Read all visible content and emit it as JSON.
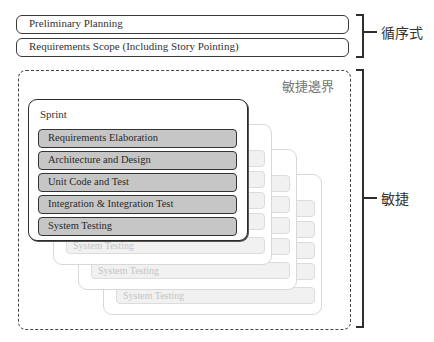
{
  "waterfall": {
    "items": [
      {
        "label": "Preliminary Planning"
      },
      {
        "label": "Requirements Scope (Including Story Pointing)"
      }
    ],
    "bracket_label": "循序式"
  },
  "agile": {
    "boundary_label": "敏捷邊界",
    "bracket_label": "敏捷",
    "sprint": {
      "title": "Sprint",
      "phases": [
        {
          "label": "Requirements Elaboration"
        },
        {
          "label": "Architecture and Design"
        },
        {
          "label": "Unit Code and Test"
        },
        {
          "label": "Integration & Integration Test"
        },
        {
          "label": "System Testing"
        }
      ]
    },
    "stacked_sprints": [
      {
        "last_phase": "System Testing"
      },
      {
        "last_phase": "System Testing"
      },
      {
        "last_phase": "System Testing"
      }
    ]
  },
  "colors": {
    "phase_fill": "#c6c6c6",
    "ghost_fill": "#f1f1f1",
    "outline": "#2c2c2c"
  }
}
